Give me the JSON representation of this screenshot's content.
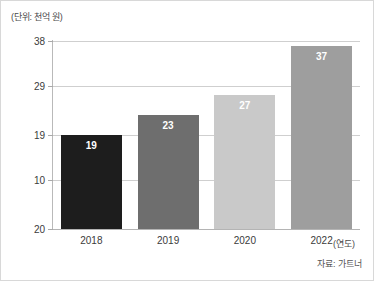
{
  "chart_data": {
    "type": "bar",
    "title": "",
    "subtitle": "",
    "unit_label": "(단위: 천억 원)",
    "xlabel": "(연도)",
    "ylabel": "",
    "categories": [
      "2018",
      "2019",
      "2020",
      "2022"
    ],
    "values": [
      19,
      23,
      27,
      37
    ],
    "series": [
      {
        "name": "",
        "values": [
          19,
          23,
          27,
          37
        ]
      }
    ],
    "bar_colors": [
      "#1d1d1d",
      "#6e6e6e",
      "#c9c9c9",
      "#9e9e9e"
    ],
    "value_label_color": "#ffffff",
    "yticks": [
      20,
      10,
      19,
      29,
      38
    ],
    "ytick_labels": [
      "20",
      "10",
      "19",
      "29",
      "38"
    ],
    "ylim": [
      0,
      40
    ],
    "grid": true,
    "grid_color": "#cfcfcf",
    "legend": "none",
    "source": "자료: 가트너"
  },
  "axes": {
    "y_ticks": [
      {
        "label": "38",
        "value": 38
      },
      {
        "label": "29",
        "value": 29
      },
      {
        "label": "19",
        "value": 19
      },
      {
        "label": "10",
        "value": 10
      },
      {
        "label": "20",
        "value": 0
      }
    ],
    "x_ticks": [
      {
        "label": "2018"
      },
      {
        "label": "2019"
      },
      {
        "label": "2020"
      },
      {
        "label": "2022"
      }
    ]
  },
  "bars": [
    {
      "category": "2018",
      "value": 19,
      "label": "19",
      "color": "#1d1d1d"
    },
    {
      "category": "2019",
      "value": 23,
      "label": "23",
      "color": "#6e6e6e"
    },
    {
      "category": "2020",
      "value": 27,
      "label": "27",
      "color": "#c9c9c9"
    },
    {
      "category": "2022",
      "value": 37,
      "label": "37",
      "color": "#9e9e9e"
    }
  ],
  "footer": {
    "source": "자료: 가트너"
  }
}
